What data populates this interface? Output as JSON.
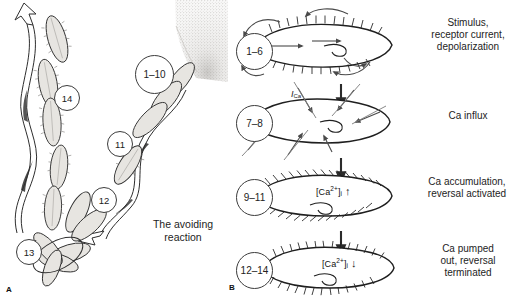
{
  "figure": {
    "panels": [
      {
        "letter": "A",
        "name": "avoiding-reaction-sequence"
      },
      {
        "letter": "B",
        "name": "ionic-mechanism-sequence"
      }
    ],
    "colors": {
      "ink": "#1a1a1a",
      "outline": "#3c3c3c",
      "cell_fill": "#e6e4e0",
      "stipple": "#b9b6b1",
      "background": "#ffffff"
    }
  },
  "panel_a": {
    "letter": "A",
    "caption": "The avoiding\nreaction",
    "markers": [
      {
        "id": "a-marker-1-10",
        "label": "1–10"
      },
      {
        "id": "a-marker-11",
        "label": "11"
      },
      {
        "id": "a-marker-12",
        "label": "12"
      },
      {
        "id": "a-marker-13",
        "label": "13"
      },
      {
        "id": "a-marker-14",
        "label": "14"
      }
    ],
    "obstacle": {
      "name": "stippled-obstacle",
      "label": ""
    },
    "paths": [
      {
        "name": "outbound-swim-path",
        "label": ""
      },
      {
        "name": "inbound-swim-path",
        "label": ""
      }
    ]
  },
  "panel_b": {
    "letter": "B",
    "steps": [
      {
        "id": "b-step-1",
        "marker": "1–6",
        "text": "Stimulus,\nreceptor current,\ndepolarization",
        "cell": "ciliated-cell-reversed-cilia",
        "inner_label": null,
        "inner_arrow": null
      },
      {
        "id": "b-step-2",
        "marker": "7–8",
        "text": "Ca influx",
        "cell": "cell-with-calcium-influx",
        "current_label": "I",
        "current_label_sub": "Ca",
        "inner_label": null,
        "inner_arrow": null
      },
      {
        "id": "b-step-3",
        "marker": "9–11",
        "text": "Ca accumulation,\nreversal activated",
        "cell": "ciliated-cell-reversal-activated",
        "inner_label_pre": "[Ca",
        "inner_label_sup": "2+",
        "inner_label_post": "]",
        "inner_label_sub": "i",
        "inner_arrow": "↑",
        "inner_arrow_name": "up-arrow-icon"
      },
      {
        "id": "b-step-4",
        "marker": "12–14",
        "text": "Ca pumped\nout, reversal\nterminated",
        "cell": "ciliated-cell-reversal-terminated",
        "inner_label_pre": "[Ca",
        "inner_label_sup": "2+",
        "inner_label_post": "]",
        "inner_label_sub": "i",
        "inner_arrow": "↓",
        "inner_arrow_name": "down-arrow-icon"
      }
    ],
    "flow_arrows": [
      {
        "name": "flow-arrow-1-to-2"
      },
      {
        "name": "flow-arrow-2-to-3"
      },
      {
        "name": "flow-arrow-3-to-4"
      }
    ]
  }
}
